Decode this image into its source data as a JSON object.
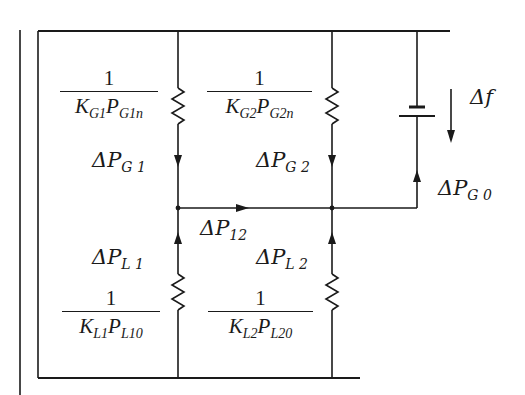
{
  "diagram": {
    "type": "equivalent-circuit",
    "colors": {
      "line": "#1a1a1a",
      "background": "#ffffff"
    },
    "labels": {
      "delta_f": {
        "sym": "Δf"
      },
      "dPG1": {
        "base": "ΔP",
        "sub": "G 1"
      },
      "dPG2": {
        "base": "ΔP",
        "sub": "G 2"
      },
      "dPG0": {
        "base": "ΔP",
        "sub": "G 0"
      },
      "dP12": {
        "base": "ΔP",
        "sub": "12"
      },
      "dPL1": {
        "base": "ΔP",
        "sub": "L 1"
      },
      "dPL2": {
        "base": "ΔP",
        "sub": "L 2"
      }
    },
    "fractions": {
      "g1": {
        "num": "1",
        "k": "K",
        "k_sub": "G1",
        "p": "P",
        "p_sub": "G1n"
      },
      "g2": {
        "num": "1",
        "k": "K",
        "k_sub": "G2",
        "p": "P",
        "p_sub": "G2n"
      },
      "l1": {
        "num": "1",
        "k": "K",
        "k_sub": "L1",
        "p": "P",
        "p_sub": "L10"
      },
      "l2": {
        "num": "1",
        "k": "K",
        "k_sub": "L2",
        "p": "P",
        "p_sub": "L20"
      }
    }
  }
}
